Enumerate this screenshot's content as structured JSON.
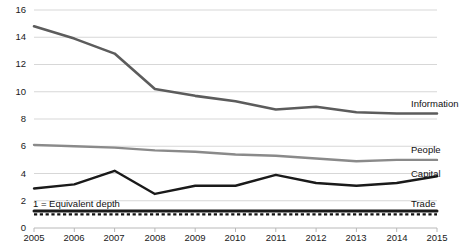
{
  "chart_data": {
    "type": "line",
    "title": "",
    "xlabel": "",
    "ylabel": "",
    "x": [
      2005,
      2006,
      2007,
      2008,
      2009,
      2010,
      2011,
      2012,
      2013,
      2014,
      2015
    ],
    "xtick_labels": [
      "2005",
      "2006",
      "2007",
      "2008",
      "2009",
      "2010",
      "2011",
      "2012",
      "2013",
      "2014",
      "2015"
    ],
    "ytick_labels": [
      "0",
      "2",
      "4",
      "6",
      "8",
      "10",
      "12",
      "14",
      "16"
    ],
    "yticks": [
      0,
      2,
      4,
      6,
      8,
      10,
      12,
      14,
      16
    ],
    "ylim": [
      0,
      16
    ],
    "xlim": [
      2005,
      2015
    ],
    "grid": "horizontal",
    "legend": "right-inline-labels",
    "series": [
      {
        "name": "Information",
        "color": "#5c5c5c",
        "width": 2.6,
        "style": "solid",
        "values": [
          14.8,
          13.9,
          12.8,
          10.2,
          9.7,
          9.3,
          8.7,
          8.9,
          8.5,
          8.4,
          8.4
        ]
      },
      {
        "name": "People",
        "color": "#8a8a8a",
        "width": 2.4,
        "style": "solid",
        "values": [
          6.1,
          6.0,
          5.9,
          5.7,
          5.6,
          5.4,
          5.3,
          5.1,
          4.9,
          5.0,
          5.0
        ]
      },
      {
        "name": "Capital",
        "color": "#1a1a1a",
        "width": 2.4,
        "style": "solid",
        "values": [
          2.9,
          3.2,
          4.2,
          2.5,
          3.1,
          3.1,
          3.9,
          3.3,
          3.1,
          3.3,
          3.8
        ]
      },
      {
        "name": "Trade",
        "color": "#1a1a1a",
        "width": 3.0,
        "style": "solid",
        "values": [
          1.25,
          1.25,
          1.25,
          1.25,
          1.25,
          1.25,
          1.25,
          1.25,
          1.25,
          1.25,
          1.25
        ]
      }
    ],
    "reference_line": {
      "name": "Equivalent depth",
      "value": 1.0,
      "style": "dotted",
      "color": "#111111",
      "width": 2.2
    },
    "annotations": [
      {
        "name": "equivalent-depth-note",
        "text": "1 = Equivalent depth",
        "value": 1.0
      }
    ]
  },
  "axis": {
    "y_title": "",
    "x_title": ""
  },
  "colors": {
    "gridline": "#d7d7d7",
    "axis": "#b8b8b8",
    "text": "#1a1a1a",
    "information": "#5c5c5c",
    "people": "#8a8a8a",
    "capital": "#1a1a1a",
    "trade": "#1a1a1a"
  }
}
